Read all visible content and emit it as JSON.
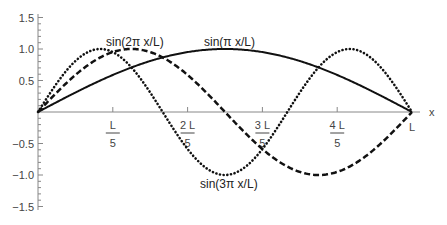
{
  "chart_data": {
    "type": "line",
    "title": "",
    "xlabel": "x",
    "ylabel": "",
    "xlim": [
      0,
      1
    ],
    "ylim": [
      -1.5,
      1.5
    ],
    "grid": false,
    "legend": "inline curve labels",
    "x_ticks": [
      {
        "num": "L",
        "den": "5",
        "value": 0.2
      },
      {
        "num": "2 L",
        "den": "5",
        "value": 0.4
      },
      {
        "num": "3 L",
        "den": "5",
        "value": 0.6
      },
      {
        "num": "4 L",
        "den": "5",
        "value": 0.8
      },
      {
        "num": "L",
        "den": "",
        "value": 1.0
      }
    ],
    "y_ticks": [
      "1.5",
      "1.0",
      "0.5",
      "-0.5",
      "-1.0",
      "-1.5"
    ],
    "series": [
      {
        "name": "sin(π x/L)",
        "style": "solid",
        "n": 1
      },
      {
        "name": "sin(2π x/L)",
        "style": "dashed",
        "n": 2
      },
      {
        "name": "sin(3π x/L)",
        "style": "dotted",
        "n": 3
      }
    ],
    "annotations": [
      {
        "text": "sin(2π x/L)",
        "x": 106,
        "y": 46
      },
      {
        "text": "sin(π x/L)",
        "x": 204,
        "y": 46
      },
      {
        "text": "sin(3π x/L)",
        "x": 201,
        "y": 187
      }
    ]
  }
}
